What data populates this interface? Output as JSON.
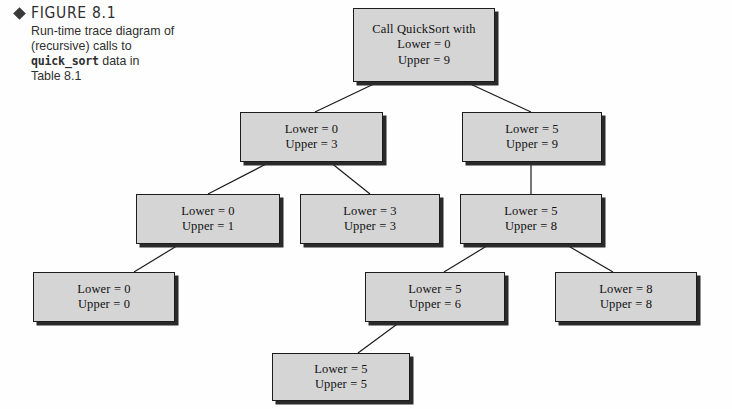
{
  "caption": {
    "marker_icon": "diamond-icon",
    "figure_label": "FIGURE 8.1",
    "line1": "Run-time trace diagram of",
    "line2": "(recursive) calls to",
    "line3_code": "quick_sort",
    "line3_rest": " data in",
    "line4": "Table 8.1"
  },
  "colors": {
    "node_fill": "#d5d5d5",
    "node_border": "#1c1c1c",
    "node_shadow": "#2a2a2a",
    "edge": "#1c1c1c",
    "background": "#fefefe",
    "text": "#111111"
  },
  "chart_data": {
    "type": "diagram",
    "title": "Run-time trace diagram of (recursive) calls to quick_sort data in Table 8.1",
    "nodes": [
      {
        "id": "n0",
        "level": 0,
        "title": "Call QuickSort with",
        "lower": "Lower = 0",
        "upper": "Upper = 9",
        "x": 353,
        "y": 8,
        "w": 142,
        "h": 74
      },
      {
        "id": "n1",
        "level": 1,
        "title": "",
        "lower": "Lower = 0",
        "upper": "Upper = 3",
        "x": 240,
        "y": 112,
        "w": 143,
        "h": 50
      },
      {
        "id": "n2",
        "level": 1,
        "title": "",
        "lower": "Lower = 5",
        "upper": "Upper = 9",
        "x": 462,
        "y": 112,
        "w": 140,
        "h": 50
      },
      {
        "id": "n3",
        "level": 2,
        "title": "",
        "lower": "Lower = 0",
        "upper": "Upper = 1",
        "x": 136,
        "y": 194,
        "w": 144,
        "h": 50
      },
      {
        "id": "n4",
        "level": 2,
        "title": "",
        "lower": "Lower = 3",
        "upper": "Upper = 3",
        "x": 300,
        "y": 194,
        "w": 140,
        "h": 50
      },
      {
        "id": "n5",
        "level": 2,
        "title": "",
        "lower": "Lower = 5",
        "upper": "Upper = 8",
        "x": 460,
        "y": 194,
        "w": 142,
        "h": 50
      },
      {
        "id": "n6",
        "level": 3,
        "title": "",
        "lower": "Lower = 0",
        "upper": "Upper = 0",
        "x": 33,
        "y": 272,
        "w": 142,
        "h": 50
      },
      {
        "id": "n7",
        "level": 3,
        "title": "",
        "lower": "Lower = 5",
        "upper": "Upper = 6",
        "x": 365,
        "y": 272,
        "w": 140,
        "h": 50
      },
      {
        "id": "n8",
        "level": 3,
        "title": "",
        "lower": "Lower = 8",
        "upper": "Upper = 8",
        "x": 555,
        "y": 272,
        "w": 142,
        "h": 50
      },
      {
        "id": "n9",
        "level": 4,
        "title": "",
        "lower": "Lower = 5",
        "upper": "Upper = 5",
        "x": 272,
        "y": 353,
        "w": 138,
        "h": 48
      }
    ],
    "edges": [
      {
        "from": "n0",
        "to": "n1",
        "x1": 378,
        "y1": 82,
        "x2": 315,
        "y2": 112
      },
      {
        "from": "n0",
        "to": "n2",
        "x1": 466,
        "y1": 82,
        "x2": 531,
        "y2": 112
      },
      {
        "from": "n1",
        "to": "n3",
        "x1": 270,
        "y1": 162,
        "x2": 208,
        "y2": 194
      },
      {
        "from": "n1",
        "to": "n4",
        "x1": 330,
        "y1": 162,
        "x2": 370,
        "y2": 194
      },
      {
        "from": "n2",
        "to": "n5",
        "x1": 531,
        "y1": 162,
        "x2": 531,
        "y2": 194
      },
      {
        "from": "n3",
        "to": "n6",
        "x1": 180,
        "y1": 244,
        "x2": 134,
        "y2": 272
      },
      {
        "from": "n5",
        "to": "n7",
        "x1": 490,
        "y1": 244,
        "x2": 444,
        "y2": 272
      },
      {
        "from": "n5",
        "to": "n8",
        "x1": 565,
        "y1": 244,
        "x2": 613,
        "y2": 272
      },
      {
        "from": "n7",
        "to": "n9",
        "x1": 400,
        "y1": 322,
        "x2": 358,
        "y2": 353
      }
    ]
  }
}
